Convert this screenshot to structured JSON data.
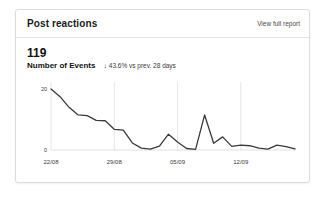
{
  "card": {
    "title": "Post reactions",
    "report_link": "View full report"
  },
  "metric": {
    "value": "119",
    "label": "Number of Events",
    "delta_arrow": "↓",
    "delta_text": "43.6% vs prev. 28 days"
  },
  "chart_data": {
    "type": "line",
    "title": "",
    "xlabel": "",
    "ylabel": "",
    "grid": true,
    "legend": "none",
    "line_color": "#3a3a3a",
    "ylim": [
      0,
      21
    ],
    "yticks": [
      0,
      20
    ],
    "ytick_labels": [
      "0",
      "20"
    ],
    "xtick_labels": [
      "22/08",
      "29/08",
      "05/09",
      "12/09"
    ],
    "xtick_indices": [
      0,
      7,
      14,
      21
    ],
    "x": [
      0,
      1,
      2,
      3,
      4,
      5,
      6,
      7,
      8,
      9,
      10,
      11,
      12,
      13,
      14,
      15,
      16,
      17,
      18,
      19,
      20,
      21,
      22,
      23,
      24,
      25,
      26,
      27
    ],
    "values": [
      20,
      17.5,
      14,
      11.5,
      11.3,
      9.7,
      9.6,
      6.8,
      6.5,
      2.3,
      0.6,
      0.3,
      1.3,
      5.2,
      2.6,
      0.5,
      0.2,
      11.5,
      2.2,
      4.3,
      1.2,
      1.6,
      1.4,
      0.6,
      0.3,
      1.6,
      1.1,
      0.4
    ],
    "series": [
      {
        "name": "Number of Events",
        "values": [
          20,
          17.5,
          14,
          11.5,
          11.3,
          9.7,
          9.6,
          6.8,
          6.5,
          2.3,
          0.6,
          0.3,
          1.3,
          5.2,
          2.6,
          0.5,
          0.2,
          11.5,
          2.2,
          4.3,
          1.2,
          1.6,
          1.4,
          0.6,
          0.3,
          1.6,
          1.1,
          0.4
        ]
      }
    ]
  }
}
